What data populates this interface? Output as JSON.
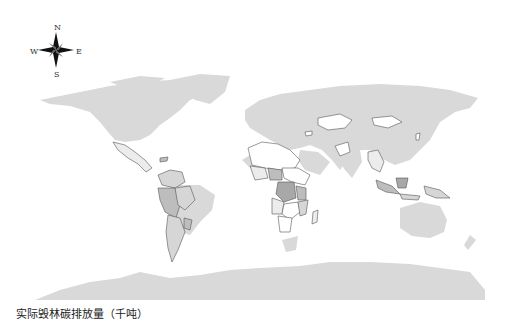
{
  "map": {
    "legend_title": "实际毁林碳排放量（千吨）",
    "compass": {
      "n": "N",
      "s": "S",
      "e": "E",
      "w": "W"
    },
    "colors": {
      "no_data": "#d9d9d9",
      "class_0": "#ffffff",
      "class_1": "#ececec",
      "class_2": "#d6d6d6",
      "class_3": "#bdbdbd",
      "class_4": "#a8a8a8",
      "border": "#555555"
    },
    "highlighted_regions": [
      "Latin America",
      "Sub-Saharan Africa",
      "Central Asia",
      "Mongolia",
      "Southeast Asia",
      "Indonesia",
      "Papua New Guinea"
    ]
  }
}
